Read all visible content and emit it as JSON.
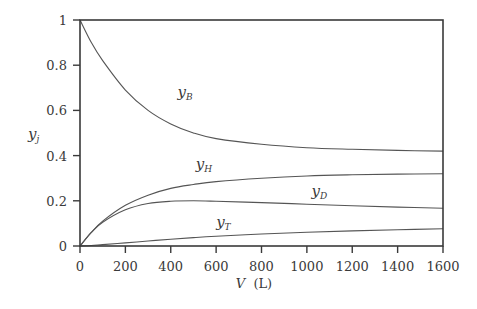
{
  "chart_data": {
    "type": "line",
    "title": "",
    "xlabel": "V (L)",
    "ylabel": "y_j",
    "xlim": [
      0,
      1600
    ],
    "ylim": [
      0,
      1
    ],
    "grid": false,
    "legend": "inline labels",
    "x_ticks": [
      "0",
      "200",
      "400",
      "600",
      "800",
      "1000",
      "1200",
      "1400",
      "1600"
    ],
    "y_ticks": [
      "0",
      "0.2",
      "0.4",
      "0.6",
      "0.8",
      "1"
    ],
    "x": [
      0,
      50,
      100,
      200,
      300,
      400,
      500,
      600,
      800,
      1000,
      1200,
      1400,
      1600
    ],
    "series": [
      {
        "name": "y_B",
        "label_main": "y",
        "label_sub": "B",
        "values": [
          1.0,
          0.9,
          0.82,
          0.69,
          0.6,
          0.54,
          0.5,
          0.475,
          0.45,
          0.435,
          0.428,
          0.423,
          0.42
        ]
      },
      {
        "name": "y_H",
        "label_main": "y",
        "label_sub": "H",
        "values": [
          0.0,
          0.06,
          0.11,
          0.18,
          0.225,
          0.255,
          0.272,
          0.285,
          0.3,
          0.31,
          0.315,
          0.318,
          0.32
        ]
      },
      {
        "name": "y_D",
        "label_main": "y",
        "label_sub": "D",
        "values": [
          0.0,
          0.06,
          0.105,
          0.16,
          0.188,
          0.198,
          0.2,
          0.198,
          0.192,
          0.185,
          0.178,
          0.172,
          0.167
        ]
      },
      {
        "name": "y_T",
        "label_main": "y",
        "label_sub": "T",
        "values": [
          0.0,
          0.002,
          0.006,
          0.014,
          0.022,
          0.03,
          0.037,
          0.043,
          0.053,
          0.061,
          0.067,
          0.072,
          0.076
        ]
      }
    ],
    "annotations": [
      {
        "series": "y_B",
        "x": 430,
        "y": 0.66
      },
      {
        "series": "y_H",
        "x": 510,
        "y": 0.34
      },
      {
        "series": "y_D",
        "x": 1020,
        "y": 0.22
      },
      {
        "series": "y_T",
        "x": 600,
        "y": 0.085
      }
    ]
  },
  "labels": {
    "xlabel_main": "V",
    "xlabel_unit": "(L)",
    "ylabel_main": "y",
    "ylabel_sub": "j"
  }
}
